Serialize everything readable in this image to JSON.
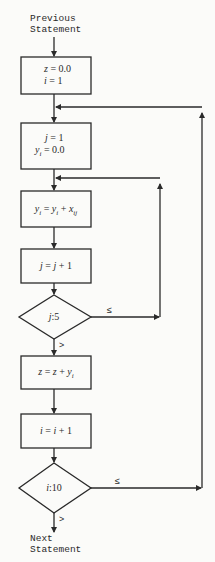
{
  "diagram": {
    "type": "flowchart",
    "colors": {
      "line": "#2a2a2a",
      "background": "#fbfbf9"
    },
    "entry": {
      "line1": "Previous",
      "line2": "Statement"
    },
    "exit": {
      "line1": "Next",
      "line2": "Statement"
    },
    "nodes": [
      {
        "id": "init",
        "shape": "process",
        "lines": [
          "z = 0.0",
          "i = 1"
        ]
      },
      {
        "id": "inner-init",
        "shape": "process",
        "lines": [
          "j = 1",
          "y_i = 0.0"
        ]
      },
      {
        "id": "accumulate",
        "shape": "process",
        "lines": [
          "y_i = y_i + x_ij"
        ]
      },
      {
        "id": "inc-j",
        "shape": "process",
        "lines": [
          "j = j + 1"
        ]
      },
      {
        "id": "test-j",
        "shape": "decision",
        "lines": [
          "j:5"
        ]
      },
      {
        "id": "sum-z",
        "shape": "process",
        "lines": [
          "z = z + y_i"
        ]
      },
      {
        "id": "inc-i",
        "shape": "process",
        "lines": [
          "i = i + 1"
        ]
      },
      {
        "id": "test-i",
        "shape": "decision",
        "lines": [
          "i:10"
        ]
      }
    ],
    "edges": [
      {
        "from": "entry",
        "to": "init"
      },
      {
        "from": "init",
        "to": "inner-init"
      },
      {
        "from": "inner-init",
        "to": "accumulate"
      },
      {
        "from": "accumulate",
        "to": "inc-j"
      },
      {
        "from": "inc-j",
        "to": "test-j"
      },
      {
        "from": "test-j",
        "to": "accumulate",
        "label": "≤"
      },
      {
        "from": "test-j",
        "to": "sum-z",
        "label": ">"
      },
      {
        "from": "sum-z",
        "to": "inc-i"
      },
      {
        "from": "inc-i",
        "to": "test-i"
      },
      {
        "from": "test-i",
        "to": "inner-init",
        "label": "≤"
      },
      {
        "from": "test-i",
        "to": "exit",
        "label": ">"
      }
    ],
    "labels": {
      "le": "≤",
      "gt": ">"
    }
  }
}
